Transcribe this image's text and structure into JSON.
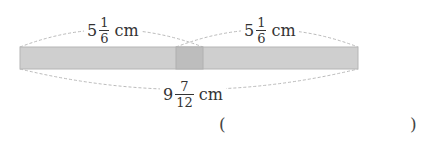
{
  "diagram": {
    "bar_color": "#cfcfcf",
    "overlap_color": "#bdbdbd",
    "arc_color": "#bbbbbb",
    "labels": {
      "left_top": {
        "whole": "5",
        "num": "1",
        "den": "6",
        "unit": "cm"
      },
      "right_top": {
        "whole": "5",
        "num": "1",
        "den": "6",
        "unit": "cm"
      },
      "bottom": {
        "whole": "9",
        "num": "7",
        "den": "12",
        "unit": "cm"
      }
    }
  },
  "answer": {
    "open": "(",
    "close": ")",
    "value": ""
  }
}
